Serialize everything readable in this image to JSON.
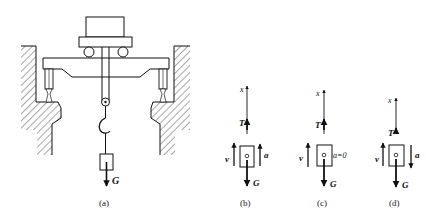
{
  "figure": {
    "panels": [
      {
        "id": "a",
        "caption": "(a)",
        "weight_label": "G",
        "description": "crane trolley on girder with hook lifting a weight between two walls"
      },
      {
        "id": "b",
        "caption": "(b)",
        "axis_label": "x",
        "tension_label": "T",
        "weight_label": "G",
        "velocity_label": "",
        "accel_label": "a",
        "accel_direction": "up"
      },
      {
        "id": "c",
        "caption": "(c)",
        "axis_label": "x",
        "tension_label": "T",
        "weight_label": "G",
        "velocity_label": "v",
        "accel_label": "a=0",
        "velocity_direction": "up"
      },
      {
        "id": "d",
        "caption": "(d)",
        "axis_label": "x",
        "tension_label": "T",
        "weight_label": "G",
        "velocity_label": "v",
        "accel_label": "a",
        "velocity_direction": "up",
        "accel_direction": "down"
      }
    ],
    "b_velocity_label": "v"
  },
  "colors": {
    "ink": "#111111",
    "background": "#ffffff"
  }
}
